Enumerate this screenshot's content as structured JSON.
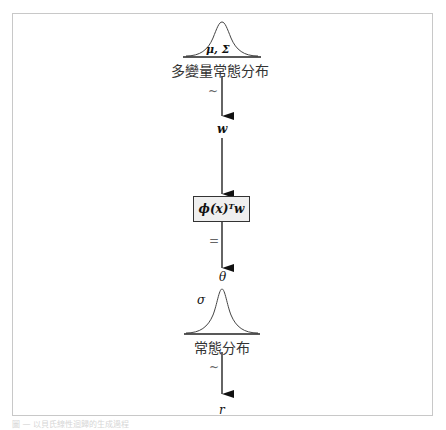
{
  "diagram": {
    "top_distribution": {
      "param_label": "μ, Σ",
      "name": "多變量常態分布"
    },
    "edge1_label": "~",
    "node_w": "w",
    "function_box": "ϕ(x)ᵀw",
    "edge2_label": "=",
    "node_theta": "θ",
    "bottom_distribution": {
      "param_label": "σ",
      "name": "常態分布"
    },
    "edge3_label": "~",
    "node_r": "r"
  },
  "caption": "圖 — 以貝氏線性迴歸的生成過程"
}
